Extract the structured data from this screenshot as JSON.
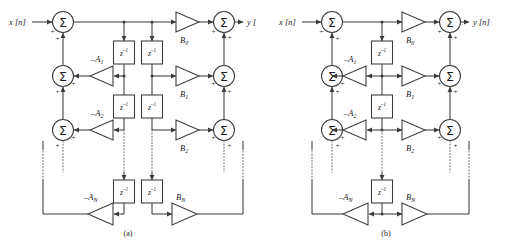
{
  "figure": {
    "subfigures": [
      {
        "id": "a",
        "caption": "(a)",
        "form": "Direct Form I",
        "delay_columns": 2
      },
      {
        "id": "b",
        "caption": "(b)",
        "form": "Direct Form II",
        "delay_columns": 1
      }
    ]
  },
  "labels": {
    "input": "x [n]",
    "output": "y [n]",
    "sigma": "Σ",
    "delay": "z",
    "delay_exp": "–1",
    "plus": "+",
    "feedback_gains": [
      "–A",
      "–A",
      "–A"
    ],
    "feedback_gain_subs": [
      "1",
      "2",
      "N"
    ],
    "feedforward_gains": [
      "B",
      "B",
      "B",
      "B"
    ],
    "feedforward_gain_subs": [
      "0",
      "1",
      "2",
      "N"
    ],
    "feedback_gain_full": [
      "–A₁",
      "–A₂",
      "–Aₙ"
    ],
    "feedforward_gain_full": [
      "B₀",
      "B₁",
      "B₂",
      "Bₙ"
    ]
  },
  "panel_a": {
    "caption": "(a)",
    "input_label": "x [n]",
    "output_label": "y [n]",
    "sum_nodes_left": [
      "Σ",
      "Σ",
      "Σ",
      "Σ"
    ],
    "sum_nodes_right": [
      "Σ",
      "Σ",
      "Σ",
      "Σ"
    ],
    "delay_blocks_left": [
      "z⁻¹",
      "z⁻¹",
      "z⁻¹"
    ],
    "delay_blocks_right": [
      "z⁻¹",
      "z⁻¹",
      "z⁻¹"
    ],
    "feedback_amps": [
      "–A1",
      "–A2",
      "–AN"
    ],
    "feedforward_amps": [
      "B0",
      "B1",
      "B2",
      "BN"
    ],
    "sign_marks": [
      "+",
      "+",
      "+",
      "+",
      "+",
      "+",
      "+",
      "+",
      "+",
      "+",
      "+",
      "+"
    ]
  },
  "panel_b": {
    "caption": "(b)",
    "input_label": "x [n]",
    "output_label": "y [n]",
    "sum_nodes_left": [
      "Σ",
      "Σ",
      "Σ",
      "Σ"
    ],
    "sum_nodes_right": [
      "Σ",
      "Σ",
      "Σ",
      "Σ"
    ],
    "delay_blocks": [
      "z⁻¹",
      "z⁻¹",
      "z⁻¹"
    ],
    "feedback_amps": [
      "–A1",
      "–A2",
      "–AN"
    ],
    "feedforward_amps": [
      "B0",
      "B1",
      "B2",
      "BN"
    ],
    "sign_marks": [
      "+",
      "+",
      "+",
      "+",
      "+",
      "+",
      "+",
      "+",
      "+",
      "+",
      "+",
      "+"
    ]
  },
  "colors": {
    "background": "#ffffff",
    "line": "#3a3a3a",
    "dotted": "#6d6d6d",
    "text": "#1a1a1a"
  }
}
